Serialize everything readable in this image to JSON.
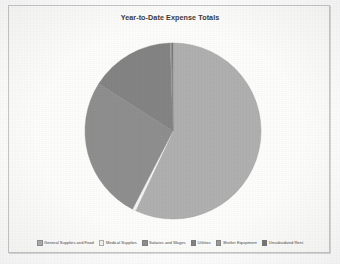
{
  "chart_frame": {
    "background_color": "#fdfdfc",
    "border_color": "#c8c8c8"
  },
  "chart_data": {
    "type": "pie",
    "title": "Year-to-Date Expense Totals",
    "xlabel": "",
    "ylabel": "",
    "legend_position": "bottom",
    "grid": false,
    "start_angle_deg": 0,
    "direction": "clockwise",
    "categories": [
      "General Supplies and Food",
      "Medical Supplies",
      "Salaries and Wages",
      "Utilities",
      "Shelter Equipment",
      "Unsubsidized Rent"
    ],
    "values": [
      57,
      0.6,
      26.4,
      15.5,
      0.3,
      0.2
    ],
    "units": "percent",
    "colors": [
      "#b0b0b0",
      "#f4f4f2",
      "#8f8f8f",
      "#848484",
      "#9a9a9a",
      "#787878"
    ],
    "slices": [
      {
        "label": "General Supplies and Food",
        "value": 57,
        "color": "#b0b0b0"
      },
      {
        "label": "Medical Supplies",
        "value": 0.6,
        "color": "#f4f4f2"
      },
      {
        "label": "Salaries and Wages",
        "value": 26.4,
        "color": "#8f8f8f"
      },
      {
        "label": "Utilities",
        "value": 15.5,
        "color": "#848484"
      },
      {
        "label": "Shelter Equipment",
        "value": 0.3,
        "color": "#9a9a9a"
      },
      {
        "label": "Unsubsidized Rent",
        "value": 0.2,
        "color": "#787878"
      }
    ]
  },
  "pie_geometry": {
    "center_x": 164,
    "center_y": 111,
    "radius": 88
  },
  "legend": {
    "items": [
      {
        "label": "General Supplies and Food",
        "color": "#b0b0b0"
      },
      {
        "label": "Medical Supplies",
        "color": "#f4f4f2"
      },
      {
        "label": "Salaries and Wages",
        "color": "#8f8f8f"
      },
      {
        "label": "Utilities",
        "color": "#848484"
      },
      {
        "label": "Shelter Equipment",
        "color": "#9a9a9a"
      },
      {
        "label": "Unsubsidized Rent",
        "color": "#787878"
      }
    ]
  }
}
